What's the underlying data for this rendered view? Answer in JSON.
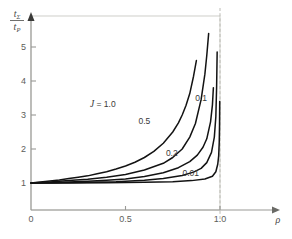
{
  "chart_data": {
    "type": "line",
    "title": "",
    "subtitle": "",
    "xlabel": "ρ",
    "ylabel_numerator": "t",
    "ylabel_numerator_sub": "Σ",
    "ylabel_denominator": "t",
    "ylabel_denominator_sub": "P",
    "xlim": [
      0,
      1.0
    ],
    "ylim": [
      0,
      5.6
    ],
    "grid": false,
    "legend_position": "inline-curve-labels",
    "xticks": [
      {
        "value": 0,
        "label": "0"
      },
      {
        "value": 0.5,
        "label": "0.5"
      },
      {
        "value": 1.0,
        "label": "1.0"
      }
    ],
    "yticks": [
      {
        "value": 1,
        "label": "1"
      },
      {
        "value": 2,
        "label": "2"
      },
      {
        "value": 3,
        "label": "3"
      },
      {
        "value": 4,
        "label": "4"
      },
      {
        "value": 5,
        "label": "5"
      }
    ],
    "annotations": [
      {
        "name": "asymptote",
        "type": "vertical-dash-dot-line",
        "x": 1.0,
        "label": ""
      }
    ],
    "series_param_name": "J",
    "series_label_prefix": "J = ",
    "series": [
      {
        "name": "J = 1.0",
        "label": "1.0",
        "J": 1.0,
        "label_x": 0.38,
        "label_y": 3.25,
        "x": [
          0.0,
          0.05,
          0.1,
          0.15,
          0.2,
          0.25,
          0.3,
          0.35,
          0.4,
          0.45,
          0.5,
          0.55,
          0.6,
          0.65,
          0.7,
          0.75,
          0.78,
          0.8,
          0.82,
          0.84,
          0.86,
          0.875
        ],
        "values": [
          1.0,
          1.03,
          1.06,
          1.09,
          1.13,
          1.17,
          1.21,
          1.27,
          1.33,
          1.41,
          1.5,
          1.61,
          1.75,
          1.93,
          2.17,
          2.5,
          2.77,
          3.0,
          3.28,
          3.63,
          4.14,
          4.6
        ]
      },
      {
        "name": "J = 0.5",
        "label": "0.5",
        "J": 0.5,
        "label_x": 0.6,
        "label_y": 2.75,
        "x": [
          0.0,
          0.1,
          0.2,
          0.3,
          0.4,
          0.5,
          0.6,
          0.7,
          0.75,
          0.8,
          0.84,
          0.87,
          0.9,
          0.92,
          0.93,
          0.94
        ],
        "values": [
          1.0,
          1.03,
          1.07,
          1.11,
          1.17,
          1.25,
          1.38,
          1.58,
          1.75,
          2.0,
          2.35,
          2.75,
          3.45,
          4.2,
          4.75,
          5.4
        ]
      },
      {
        "name": "J = 0.2",
        "label": "0.2",
        "J": 0.2,
        "label_x": 0.745,
        "label_y": 1.8,
        "x": [
          0.0,
          0.1,
          0.2,
          0.3,
          0.4,
          0.5,
          0.6,
          0.7,
          0.78,
          0.84,
          0.88,
          0.91,
          0.93,
          0.95,
          0.96,
          0.965
        ],
        "values": [
          1.0,
          1.01,
          1.03,
          1.05,
          1.08,
          1.12,
          1.19,
          1.3,
          1.45,
          1.63,
          1.82,
          2.05,
          2.3,
          2.8,
          3.3,
          3.8
        ]
      },
      {
        "name": "J = 0.1",
        "label": "0.1",
        "J": 0.1,
        "label_x": 0.9,
        "label_y": 3.4,
        "x": [
          0.0,
          0.15,
          0.3,
          0.45,
          0.6,
          0.7,
          0.8,
          0.86,
          0.9,
          0.93,
          0.955,
          0.97,
          0.978,
          0.982,
          0.985
        ],
        "values": [
          1.0,
          1.01,
          1.02,
          1.04,
          1.08,
          1.13,
          1.22,
          1.32,
          1.43,
          1.6,
          1.9,
          2.35,
          2.95,
          3.8,
          4.85
        ]
      },
      {
        "name": "J = 0.01",
        "label": "0.01",
        "J": 0.01,
        "label_x": 0.845,
        "label_y": 1.22,
        "x": [
          0.0,
          0.2,
          0.4,
          0.6,
          0.75,
          0.85,
          0.92,
          0.96,
          0.978,
          0.988,
          0.993,
          0.996,
          0.9975,
          0.9985
        ],
        "values": [
          1.0,
          1.0,
          1.01,
          1.02,
          1.04,
          1.07,
          1.12,
          1.2,
          1.33,
          1.55,
          1.8,
          2.2,
          2.7,
          3.4
        ]
      }
    ]
  },
  "figure": {
    "name": "response-time-vs-utilization-plot",
    "axis_arrow_x": "▶",
    "axis_arrow_y": "▲"
  }
}
